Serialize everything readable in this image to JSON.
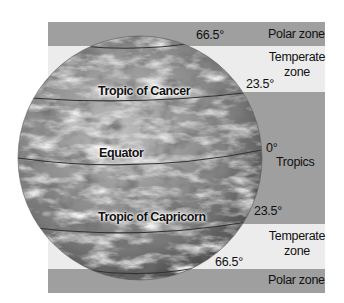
{
  "zones": {
    "polar_top": "Polar zone",
    "temperate_top_line1": "Temperate",
    "temperate_top_line2": "zone",
    "tropics": "Tropics",
    "temperate_bottom_line1": "Temperate",
    "temperate_bottom_line2": "zone",
    "polar_bottom": "Polar zone"
  },
  "latitudes": {
    "north_arctic": "66.5°",
    "north_tropic": "23.5°",
    "equator": "0°",
    "south_tropic": "23.5°",
    "south_antarctic": "66.5°"
  },
  "globe_labels": {
    "tropic_of_cancer": "Tropic of Cancer",
    "equator": "Equator",
    "tropic_of_capricorn": "Tropic of Capricorn"
  },
  "colors": {
    "polar_band": "#9f9f9f",
    "temperate_band": "#ececec",
    "tropics_band": "#9f9f9f"
  }
}
